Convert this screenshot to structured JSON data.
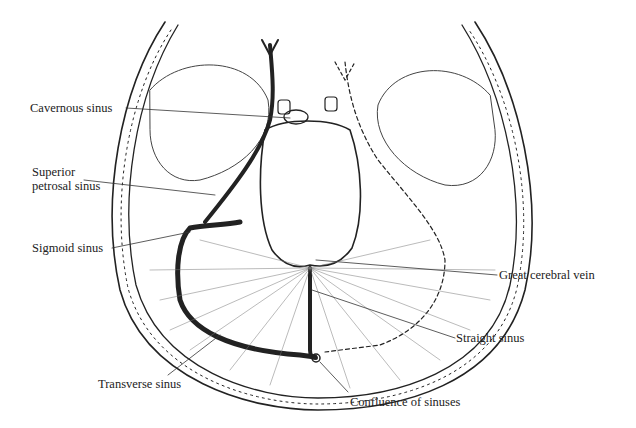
{
  "figure": {
    "colors": {
      "ink": "#222222",
      "background": "#ffffff",
      "hatch": "#555555"
    }
  },
  "labels": {
    "cavernous_sinus": "Cavernous sinus",
    "superior_petrosal_sinus_line1": "Superior",
    "superior_petrosal_sinus_line2": "petrosal sinus",
    "sigmoid_sinus": "Sigmoid sinus",
    "great_cerebral_vein": "Great cerebral vein",
    "straight_sinus": "Straight sinus",
    "transverse_sinus": "Transverse sinus",
    "confluence_of_sinuses": "Confluence of sinuses"
  }
}
